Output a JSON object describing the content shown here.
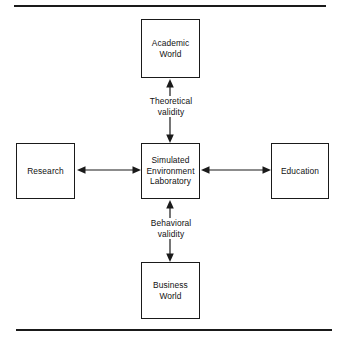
{
  "figure": {
    "type": "hub-and-spoke block diagram",
    "rules": {
      "top": "horizontal-rule",
      "bottom": "horizontal-rule"
    }
  },
  "nodes": {
    "academic": {
      "label": "Academic\nWorld",
      "position": "top"
    },
    "research": {
      "label": "Research",
      "position": "left"
    },
    "center": {
      "label": "Simulated\nEnvironment\nLaboratory",
      "position": "center"
    },
    "education": {
      "label": "Education",
      "position": "right"
    },
    "business": {
      "label": "Business\nWorld",
      "position": "bottom"
    }
  },
  "edges": [
    {
      "id": "theoretical",
      "label": "Theoretical\nvalidity",
      "from": "center",
      "to": "academic",
      "direction": "bidirectional",
      "orientation": "vertical"
    },
    {
      "id": "behavioral",
      "label": "Behavioral\nvalidity",
      "from": "center",
      "to": "business",
      "direction": "bidirectional",
      "orientation": "vertical"
    },
    {
      "id": "research-center",
      "label": "",
      "from": "research",
      "to": "center",
      "direction": "bidirectional",
      "orientation": "horizontal"
    },
    {
      "id": "center-education",
      "label": "",
      "from": "center",
      "to": "education",
      "direction": "bidirectional",
      "orientation": "horizontal"
    }
  ],
  "colors": {
    "stroke": "#1a1a1a",
    "text": "#111111",
    "background": "#ffffff"
  }
}
